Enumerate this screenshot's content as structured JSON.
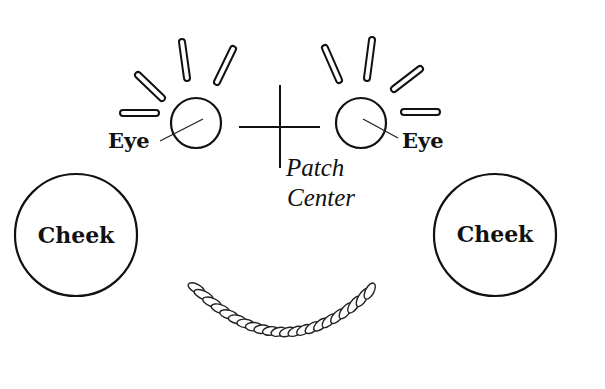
{
  "diagram": {
    "background": "#ffffff",
    "stroke_color": "#111111",
    "labels": {
      "left_eye": "Eye",
      "right_eye": "Eye",
      "patch_center_line1": "Patch",
      "patch_center_line2": "Center",
      "left_cheek": "Cheek",
      "right_cheek": "Cheek"
    },
    "shapes": {
      "left_eye_circle": {
        "cx": 196,
        "cy": 123,
        "r": 25
      },
      "right_eye_circle": {
        "cx": 361,
        "cy": 123,
        "r": 25
      },
      "left_cheek_circle": {
        "cx": 76,
        "cy": 235,
        "r": 61
      },
      "right_cheek_circle": {
        "cx": 495,
        "cy": 235,
        "r": 61
      },
      "crosshair": {
        "h": [
          239,
          127,
          320,
          127
        ],
        "v": [
          280,
          85,
          280,
          168
        ]
      }
    },
    "rays": {
      "left": [
        {
          "x1": 123,
          "y1": 113,
          "x2": 156,
          "y2": 113
        },
        {
          "x1": 138,
          "y1": 75,
          "x2": 162,
          "y2": 98
        },
        {
          "x1": 182,
          "y1": 42,
          "x2": 187,
          "y2": 78
        },
        {
          "x1": 233,
          "y1": 49,
          "x2": 217,
          "y2": 82
        }
      ],
      "right": [
        {
          "x1": 325,
          "y1": 48,
          "x2": 339,
          "y2": 80
        },
        {
          "x1": 372,
          "y1": 40,
          "x2": 367,
          "y2": 78
        },
        {
          "x1": 420,
          "y1": 69,
          "x2": 394,
          "y2": 89
        },
        {
          "x1": 404,
          "y1": 112,
          "x2": 437,
          "y2": 112
        }
      ]
    },
    "smile": {
      "type": "twisted-rope",
      "start": [
        191,
        283
      ],
      "control": [
        283,
        380
      ],
      "end": [
        375,
        286
      ],
      "segments": 22
    }
  }
}
